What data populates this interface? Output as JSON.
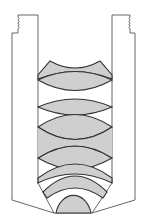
{
  "diagram": {
    "title": "Microscope objective lens cross-section",
    "colors": {
      "background": "#ffffff",
      "housing_stroke": "#555555",
      "lens_fill": "#cfcfcf",
      "lens_stroke": "#333333"
    },
    "components": [
      {
        "id": "housing",
        "label": "Objective housing (threaded barrel)"
      },
      {
        "id": "lens-1",
        "label": "Meniscus element (top)"
      },
      {
        "id": "lens-2",
        "label": "Biconvex lens"
      },
      {
        "id": "lens-3",
        "label": "Biconvex lens"
      },
      {
        "id": "lens-4",
        "label": "Biconvex lens"
      },
      {
        "id": "lens-5",
        "label": "Biconvex lens"
      },
      {
        "id": "lens-6",
        "label": "Meniscus lens"
      },
      {
        "id": "lens-7",
        "label": "Meniscus lens"
      },
      {
        "id": "front-lens",
        "label": "Hemispherical front lens"
      }
    ]
  }
}
